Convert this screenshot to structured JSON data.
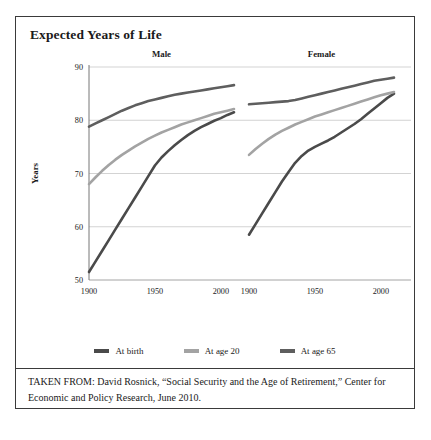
{
  "figure": {
    "title": "Expected Years of Life",
    "source_note": "TAKEN FROM: David Rosnick, “Social Security and the Age of Retirement,” Center for Economic and Policy Research, June 2010."
  },
  "chart_data": {
    "type": "line",
    "title": "Expected Years of Life",
    "xlabel": "Year of Birth",
    "ylabel": "Years",
    "ylim": [
      50,
      90
    ],
    "yticks": [
      50,
      60,
      70,
      80,
      90
    ],
    "xlim": [
      1900,
      2010
    ],
    "xticks": [
      1900,
      1950,
      2000
    ],
    "grid": "horizontal",
    "legend_position": "bottom",
    "panels": [
      {
        "name": "Male",
        "label": "Male",
        "series": [
          {
            "name": "At birth",
            "color": "#4a4a4a",
            "x": [
              1900,
              1905,
              1910,
              1915,
              1920,
              1925,
              1930,
              1935,
              1940,
              1945,
              1950,
              1955,
              1960,
              1965,
              1970,
              1975,
              1980,
              1985,
              1990,
              1995,
              2000,
              2005,
              2010
            ],
            "y": [
              51.5,
              53.5,
              55.5,
              57.5,
              59.5,
              61.5,
              63.5,
              65.5,
              67.5,
              69.5,
              71.5,
              73.0,
              74.2,
              75.3,
              76.3,
              77.2,
              78.0,
              78.7,
              79.3,
              79.9,
              80.4,
              81.0,
              81.5
            ]
          },
          {
            "name": "At age 20",
            "color": "#a3a3a3",
            "x": [
              1900,
              1905,
              1910,
              1915,
              1920,
              1925,
              1930,
              1935,
              1940,
              1945,
              1950,
              1955,
              1960,
              1965,
              1970,
              1975,
              1980,
              1985,
              1990,
              1995,
              2000,
              2005,
              2010
            ],
            "y": [
              68.0,
              69.3,
              70.5,
              71.6,
              72.6,
              73.5,
              74.3,
              75.1,
              75.8,
              76.5,
              77.1,
              77.7,
              78.2,
              78.7,
              79.2,
              79.6,
              80.0,
              80.4,
              80.8,
              81.2,
              81.5,
              81.8,
              82.1
            ]
          },
          {
            "name": "At age 65",
            "color": "#5e5e5e",
            "x": [
              1900,
              1905,
              1910,
              1915,
              1920,
              1925,
              1930,
              1935,
              1940,
              1945,
              1950,
              1955,
              1960,
              1965,
              1970,
              1975,
              1980,
              1985,
              1990,
              1995,
              2000,
              2005,
              2010
            ],
            "y": [
              78.8,
              79.4,
              80.0,
              80.6,
              81.2,
              81.8,
              82.3,
              82.8,
              83.2,
              83.6,
              83.9,
              84.2,
              84.5,
              84.8,
              85.0,
              85.2,
              85.4,
              85.6,
              85.8,
              86.0,
              86.2,
              86.4,
              86.6
            ]
          }
        ]
      },
      {
        "name": "Female",
        "label": "Female",
        "series": [
          {
            "name": "At birth",
            "color": "#4a4a4a",
            "x": [
              1900,
              1905,
              1910,
              1915,
              1920,
              1925,
              1930,
              1935,
              1940,
              1945,
              1950,
              1955,
              1960,
              1965,
              1970,
              1975,
              1980,
              1985,
              1990,
              1995,
              2000,
              2005,
              2010
            ],
            "y": [
              58.5,
              60.5,
              62.5,
              64.5,
              66.5,
              68.5,
              70.3,
              72.0,
              73.3,
              74.3,
              75.0,
              75.6,
              76.2,
              76.9,
              77.7,
              78.5,
              79.3,
              80.2,
              81.2,
              82.2,
              83.2,
              84.2,
              85.0
            ]
          },
          {
            "name": "At age 20",
            "color": "#a3a3a3",
            "x": [
              1900,
              1905,
              1910,
              1915,
              1920,
              1925,
              1930,
              1935,
              1940,
              1945,
              1950,
              1955,
              1960,
              1965,
              1970,
              1975,
              1980,
              1985,
              1990,
              1995,
              2000,
              2005,
              2010
            ],
            "y": [
              73.5,
              74.6,
              75.6,
              76.5,
              77.3,
              78.0,
              78.6,
              79.2,
              79.7,
              80.2,
              80.7,
              81.1,
              81.5,
              81.9,
              82.3,
              82.7,
              83.1,
              83.5,
              83.9,
              84.3,
              84.7,
              85.0,
              85.3
            ]
          },
          {
            "name": "At age 65",
            "color": "#5e5e5e",
            "x": [
              1900,
              1905,
              1910,
              1915,
              1920,
              1925,
              1930,
              1935,
              1940,
              1945,
              1950,
              1955,
              1960,
              1965,
              1970,
              1975,
              1980,
              1985,
              1990,
              1995,
              2000,
              2005,
              2010
            ],
            "y": [
              83.0,
              83.1,
              83.2,
              83.3,
              83.4,
              83.5,
              83.6,
              83.8,
              84.1,
              84.4,
              84.7,
              85.0,
              85.3,
              85.6,
              85.9,
              86.2,
              86.5,
              86.8,
              87.1,
              87.4,
              87.6,
              87.8,
              88.0
            ]
          }
        ]
      }
    ],
    "legend": [
      {
        "label": "At birth",
        "color": "#4a4a4a"
      },
      {
        "label": "At age 20",
        "color": "#a3a3a3"
      },
      {
        "label": "At age 65",
        "color": "#5e5e5e"
      }
    ]
  },
  "colors": {
    "border": "#3a3a3a",
    "grid": "#c8c8c8",
    "axis": "#555555",
    "text": "#1a1a1a"
  }
}
